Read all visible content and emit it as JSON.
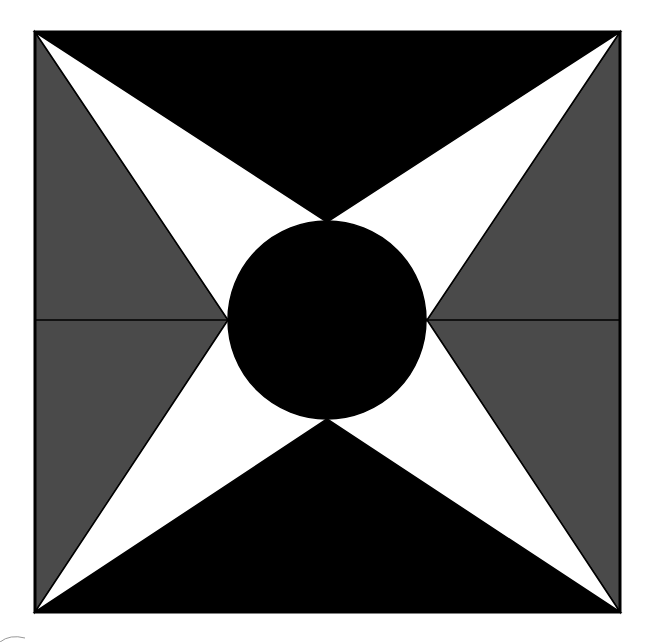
{
  "diagram": {
    "colors": {
      "background": "#ffffff",
      "dark": "#000000",
      "gray": "#4a4a4a",
      "light": "#ffffff",
      "stroke": "#000000"
    },
    "pieces": [
      {
        "name": "top-triangle",
        "color_key": "dark"
      },
      {
        "name": "bottom-triangle",
        "color_key": "dark"
      },
      {
        "name": "left-triangle",
        "color_key": "gray"
      },
      {
        "name": "right-triangle",
        "color_key": "gray"
      },
      {
        "name": "star-point-top-left",
        "color_key": "light"
      },
      {
        "name": "star-point-top-right",
        "color_key": "light"
      },
      {
        "name": "star-point-bottom-left",
        "color_key": "light"
      },
      {
        "name": "star-point-bottom-right",
        "color_key": "light"
      },
      {
        "name": "center-circle",
        "color_key": "dark"
      }
    ]
  }
}
